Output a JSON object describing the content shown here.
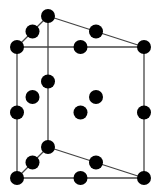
{
  "diagram": {
    "title": "",
    "colors": {
      "atom": "#000000",
      "edge": "#444444",
      "background": "#ffffff"
    },
    "atoms": [
      {
        "id": "top-back-corner",
        "pos": [
          0,
          1,
          1
        ]
      },
      {
        "id": "top-left-front-corner",
        "pos": [
          0,
          0,
          1
        ]
      },
      {
        "id": "top-right-front-corner",
        "pos": [
          1,
          0,
          1
        ]
      },
      {
        "id": "top-left-edge-mid",
        "pos": [
          0,
          0.5,
          1
        ]
      },
      {
        "id": "top-diagonal-mid",
        "pos": [
          0.5,
          0.5,
          1
        ]
      },
      {
        "id": "top-front-edge-mid",
        "pos": [
          0.5,
          0,
          1
        ]
      },
      {
        "id": "back-edge-mid",
        "pos": [
          0,
          1,
          0.5
        ]
      },
      {
        "id": "interior-left",
        "pos": [
          0,
          0.5,
          0.5
        ]
      },
      {
        "id": "interior-right",
        "pos": [
          0.5,
          0.5,
          0.5
        ]
      },
      {
        "id": "left-front-edge-mid",
        "pos": [
          0,
          0,
          0.5
        ]
      },
      {
        "id": "front-face-center",
        "pos": [
          0.5,
          0,
          0.5
        ]
      },
      {
        "id": "right-front-edge-mid",
        "pos": [
          1,
          0,
          0.5
        ]
      },
      {
        "id": "bottom-back-corner",
        "pos": [
          0,
          1,
          0
        ]
      },
      {
        "id": "bottom-left-edge-mid",
        "pos": [
          0,
          0.5,
          0
        ]
      },
      {
        "id": "bottom-diagonal-mid",
        "pos": [
          0.5,
          0.5,
          0
        ]
      },
      {
        "id": "bottom-left-front-corner",
        "pos": [
          0,
          0,
          0
        ]
      },
      {
        "id": "bottom-front-edge-mid",
        "pos": [
          0.5,
          0,
          0
        ]
      },
      {
        "id": "bottom-right-front-corner",
        "pos": [
          1,
          0,
          0
        ]
      }
    ],
    "edges": [
      [
        "top-back-corner",
        "top-left-front-corner"
      ],
      [
        "top-back-corner",
        "top-right-front-corner"
      ],
      [
        "top-left-front-corner",
        "top-right-front-corner"
      ],
      [
        "bottom-back-corner",
        "bottom-left-front-corner"
      ],
      [
        "bottom-back-corner",
        "bottom-right-front-corner"
      ],
      [
        "bottom-left-front-corner",
        "bottom-right-front-corner"
      ],
      [
        "top-back-corner",
        "bottom-back-corner"
      ],
      [
        "top-left-front-corner",
        "bottom-left-front-corner"
      ],
      [
        "top-right-front-corner",
        "bottom-right-front-corner"
      ]
    ]
  }
}
